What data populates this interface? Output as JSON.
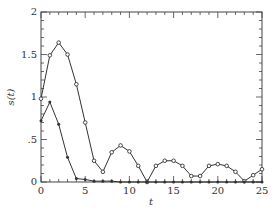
{
  "chart_data": {
    "type": "line",
    "title": "",
    "xlabel": "t",
    "ylabel": "s(t)",
    "xlim": [
      0,
      25
    ],
    "ylim": [
      0,
      2
    ],
    "xticks": [
      "0",
      "5",
      "10",
      "15",
      "20",
      "25"
    ],
    "yticks": [
      "0",
      ".5",
      "1",
      "1.5",
      "2"
    ],
    "grid": false,
    "legend": null,
    "x": [
      0,
      1,
      2,
      3,
      4,
      5,
      6,
      7,
      8,
      9,
      10,
      11,
      12,
      13,
      14,
      15,
      16,
      17,
      18,
      19,
      20,
      21,
      22,
      23,
      24,
      25
    ],
    "series": [
      {
        "name": "upper (open circle markers)",
        "marker": "circle",
        "values": [
          0.98,
          1.49,
          1.64,
          1.5,
          1.15,
          0.7,
          0.25,
          0.12,
          0.35,
          0.43,
          0.36,
          0.19,
          0.0,
          0.19,
          0.25,
          0.25,
          0.19,
          0.07,
          0.07,
          0.19,
          0.21,
          0.19,
          0.12,
          0.01,
          0.08,
          0.15
        ]
      },
      {
        "name": "lower (filled markers)",
        "marker": "dot",
        "values": [
          0.72,
          0.94,
          0.68,
          0.29,
          0.04,
          0.03,
          0.01,
          0.01,
          0.01,
          0.0,
          0.0,
          0.0,
          0.0,
          0.0,
          0.0,
          0.0,
          0.0,
          0.0,
          0.0,
          0.0,
          0.0,
          0.0,
          0.0,
          0.0,
          0.0,
          0.0
        ]
      }
    ]
  },
  "colors": {
    "line": "#333333",
    "axis": "#444444",
    "background": "#ffffff"
  }
}
